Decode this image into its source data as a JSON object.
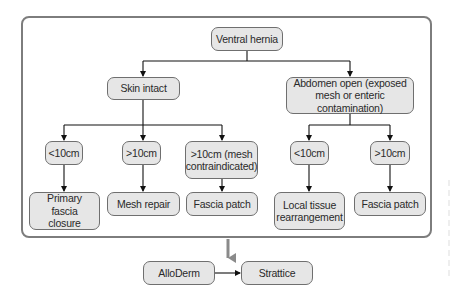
{
  "diagram": {
    "type": "flowchart",
    "colors": {
      "node_fill": "#e6e6e6",
      "node_border": "#6f6f6f",
      "edge": "#111111",
      "frame": "#7d7d7d",
      "gray_arrow": "#8a8a8a"
    },
    "nodes": {
      "root": "Ventral hernia",
      "skin_intact": "Skin intact",
      "abdomen_open": "Abdomen open (exposed mesh or enteric contamination)",
      "skin_lt10": "<10cm",
      "skin_gt10": ">10cm",
      "skin_gt10_contra": ">10cm (mesh contraindicated)",
      "open_lt10": "<10cm",
      "open_gt10": ">10cm",
      "primary_fascia_closure": "Primary fascia closure",
      "mesh_repair": "Mesh repair",
      "fascia_patch_1": "Fascia patch",
      "local_tissue": "Local tissue rearrangement",
      "fascia_patch_2": "Fascia patch",
      "alloderm": "AlloDerm",
      "strattice": "Strattice"
    },
    "edges": [
      [
        "Ventral hernia",
        "Skin intact"
      ],
      [
        "Ventral hernia",
        "Abdomen open (exposed mesh or enteric contamination)"
      ],
      [
        "Skin intact",
        "<10cm"
      ],
      [
        "Skin intact",
        ">10cm"
      ],
      [
        "Skin intact",
        ">10cm (mesh contraindicated)"
      ],
      [
        "Abdomen open (exposed mesh or enteric contamination)",
        "<10cm"
      ],
      [
        "Abdomen open (exposed mesh or enteric contamination)",
        ">10cm"
      ],
      [
        "<10cm",
        "Primary fascia closure"
      ],
      [
        ">10cm",
        "Mesh repair"
      ],
      [
        ">10cm (mesh contraindicated)",
        "Fascia patch"
      ],
      [
        "<10cm",
        "Local tissue rearrangement"
      ],
      [
        ">10cm",
        "Fascia patch"
      ],
      [
        "Framed algorithm",
        "AlloDerm"
      ],
      [
        "AlloDerm",
        "Strattice"
      ]
    ]
  }
}
